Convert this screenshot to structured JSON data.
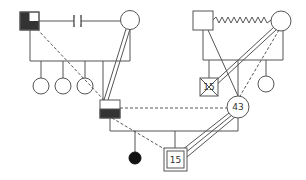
{
  "diagram": {
    "type": "genogram",
    "colors": {
      "line": "#555555",
      "fill_dark": "#333333",
      "background": "#ffffff"
    },
    "people": [
      {
        "id": "gen1-male-left",
        "shape": "square",
        "fill": "dark-with-white-top-right-quadrant",
        "label": ""
      },
      {
        "id": "gen1-female-left",
        "shape": "circle",
        "fill": "none",
        "label": ""
      },
      {
        "id": "gen1-male-right",
        "shape": "square",
        "fill": "none",
        "label": ""
      },
      {
        "id": "gen1-female-right",
        "shape": "circle",
        "fill": "none",
        "label": ""
      },
      {
        "id": "gen2-daughter-1",
        "shape": "circle",
        "label": ""
      },
      {
        "id": "gen2-daughter-2",
        "shape": "circle",
        "label": ""
      },
      {
        "id": "gen2-daughter-3",
        "shape": "circle",
        "label": ""
      },
      {
        "id": "gen2-son-left",
        "shape": "square",
        "fill": "bottom-half-dark",
        "label": ""
      },
      {
        "id": "gen2-son-deceased",
        "shape": "square",
        "crossed": true,
        "label": "15"
      },
      {
        "id": "gen2-wife",
        "shape": "circle",
        "label": "43"
      },
      {
        "id": "gen2-daughter-right",
        "shape": "circle",
        "label": ""
      },
      {
        "id": "gen3-child-deceased",
        "shape": "filled-dot",
        "label": ""
      },
      {
        "id": "gen3-index-son",
        "shape": "double-square",
        "label": "15"
      }
    ],
    "relationships": [
      {
        "from": "gen1-male-left",
        "to": "gen1-female-left",
        "type": "divorce"
      },
      {
        "from": "gen1-male-right",
        "to": "gen1-female-right",
        "type": "conflict"
      },
      {
        "from": "gen1-female-left",
        "to": "gen2-son-left",
        "type": "close"
      },
      {
        "from": "gen1-female-right",
        "to": "gen2-son-deceased",
        "type": "close"
      },
      {
        "from": "gen1-male-left",
        "to": "gen2-son-left",
        "type": "distant"
      },
      {
        "from": "gen1-female-right",
        "to": "gen2-wife",
        "type": "distant"
      },
      {
        "from": "gen2-son-left",
        "to": "gen2-wife",
        "type": "distant-marriage"
      },
      {
        "from": "gen2-son-left",
        "to": "gen3-index-son",
        "type": "distant"
      },
      {
        "from": "gen2-wife",
        "to": "gen3-index-son",
        "type": "very-close"
      }
    ]
  }
}
